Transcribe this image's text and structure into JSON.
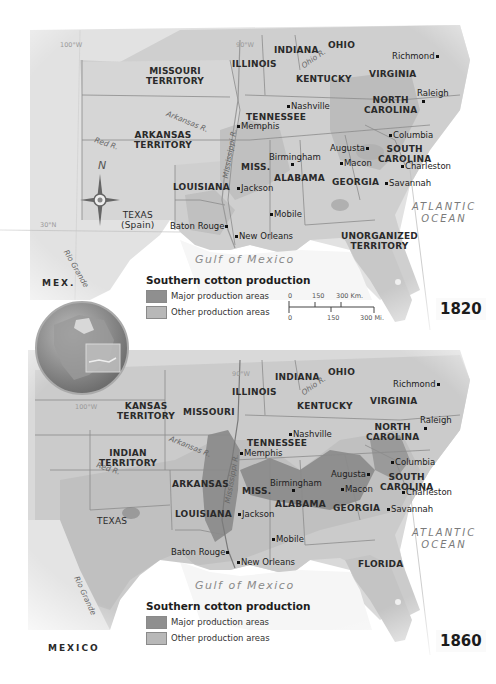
{
  "colors": {
    "land_base": "#d4d4d4",
    "land_us": "#c6c6c6",
    "land_light": "#e6e6e6",
    "water": "#f7f7f7",
    "major_production": "#8f8f8f",
    "other_production": "#b2b2b2",
    "border": "#8c8c8c",
    "text": "#2a2a2a"
  },
  "map_1820": {
    "year": "1820",
    "states": [
      {
        "id": "indiana",
        "label": "INDIANA"
      },
      {
        "id": "ohio",
        "label": "OHIO"
      },
      {
        "id": "missouri-territory",
        "label1": "MISSOURI",
        "label2": "TERRITORY"
      },
      {
        "id": "illinois",
        "label": "ILLINOIS"
      },
      {
        "id": "kentucky",
        "label": "KENTUCKY"
      },
      {
        "id": "virginia",
        "label": "VIRGINIA"
      },
      {
        "id": "tennessee",
        "label": "TENNESSEE"
      },
      {
        "id": "north-carolina",
        "label1": "NORTH",
        "label2": "CAROLINA"
      },
      {
        "id": "arkansas-territory",
        "label1": "ARKANSAS",
        "label2": "TERRITORY"
      },
      {
        "id": "miss",
        "label": "MISS."
      },
      {
        "id": "alabama",
        "label": "ALABAMA"
      },
      {
        "id": "georgia",
        "label": "GEORGIA"
      },
      {
        "id": "south-carolina",
        "label1": "SOUTH",
        "label2": "CAROLINA"
      },
      {
        "id": "louisiana",
        "label": "LOUISIANA"
      },
      {
        "id": "texas",
        "label1": "TEXAS",
        "label2": "(Spain)"
      },
      {
        "id": "unorganized-territory",
        "label1": "UNORGANIZED",
        "label2": "TERRITORY"
      }
    ],
    "cities": [
      "Richmond",
      "Raleigh",
      "Nashville",
      "Memphis",
      "Columbia",
      "Augusta",
      "Birmingham",
      "Macon",
      "Charleston",
      "Jackson",
      "Savannah",
      "Mobile",
      "Baton Rouge",
      "New Orleans"
    ],
    "rivers": [
      "Ohio R.",
      "Arkansas R.",
      "Red R.",
      "Mississippi R.",
      "Rio Grande"
    ],
    "water": {
      "ocean_line1": "ATLANTIC",
      "ocean_line2": "OCEAN",
      "gulf": "Gulf of Mexico"
    },
    "other": {
      "mexico": "MEX.",
      "compass_n": "N",
      "lon_100": "100°W",
      "lon_90": "90°W",
      "lat_30": "30°N"
    },
    "legend": {
      "title": "Southern cotton production",
      "major": "Major production areas",
      "other": "Other production areas"
    },
    "scale": {
      "km_ticks": [
        "0",
        "150",
        "300 Km."
      ],
      "mi_ticks": [
        "0",
        "150",
        "300 Mi."
      ]
    }
  },
  "map_1860": {
    "year": "1860",
    "states": [
      {
        "id": "indiana",
        "label": "INDIANA"
      },
      {
        "id": "ohio",
        "label": "OHIO"
      },
      {
        "id": "kansas-territory",
        "label1": "KANSAS",
        "label2": "TERRITORY"
      },
      {
        "id": "missouri",
        "label": "MISSOURI"
      },
      {
        "id": "illinois",
        "label": "ILLINOIS"
      },
      {
        "id": "kentucky",
        "label": "KENTUCKY"
      },
      {
        "id": "virginia",
        "label": "VIRGINIA"
      },
      {
        "id": "indian-territory",
        "label1": "INDIAN",
        "label2": "TERRITORY"
      },
      {
        "id": "tennessee",
        "label": "TENNESSEE"
      },
      {
        "id": "north-carolina",
        "label1": "NORTH",
        "label2": "CAROLINA"
      },
      {
        "id": "arkansas",
        "label": "ARKANSAS"
      },
      {
        "id": "miss",
        "label": "MISS."
      },
      {
        "id": "alabama",
        "label": "ALABAMA"
      },
      {
        "id": "georgia",
        "label": "GEORGIA"
      },
      {
        "id": "south-carolina",
        "label1": "SOUTH",
        "label2": "CAROLINA"
      },
      {
        "id": "texas",
        "label": "TEXAS"
      },
      {
        "id": "louisiana",
        "label": "LOUISIANA"
      },
      {
        "id": "florida",
        "label": "FLORIDA"
      }
    ],
    "cities": [
      "Richmond",
      "Raleigh",
      "Nashville",
      "Memphis",
      "Columbia",
      "Augusta",
      "Birmingham",
      "Macon",
      "Charleston",
      "Jackson",
      "Savannah",
      "Mobile",
      "Baton Rouge",
      "New Orleans"
    ],
    "rivers": [
      "Ohio R.",
      "Arkansas R.",
      "Red R.",
      "Mississippi R.",
      "Rio Grande"
    ],
    "water": {
      "ocean_line1": "ATLANTIC",
      "ocean_line2": "OCEAN",
      "gulf": "Gulf of Mexico"
    },
    "other": {
      "mexico": "MEXICO",
      "lon_100": "100°W",
      "lon_90": "90°W"
    },
    "legend": {
      "title": "Southern cotton production",
      "major": "Major production areas",
      "other": "Other production areas"
    }
  }
}
